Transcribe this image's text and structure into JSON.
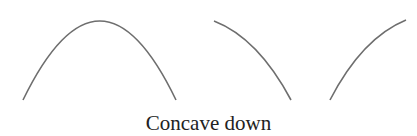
{
  "caption": "Concave down",
  "stroke_color": "#6e6e6e",
  "curves": [
    {
      "name": "full-arch",
      "path": "M23,100 Q100,-58 176,100"
    },
    {
      "name": "decreasing-concave-down",
      "path": "M214,21 Q258,38 291,100"
    },
    {
      "name": "increasing-concave-down",
      "path": "M330,100 Q362,38 406,20"
    }
  ]
}
